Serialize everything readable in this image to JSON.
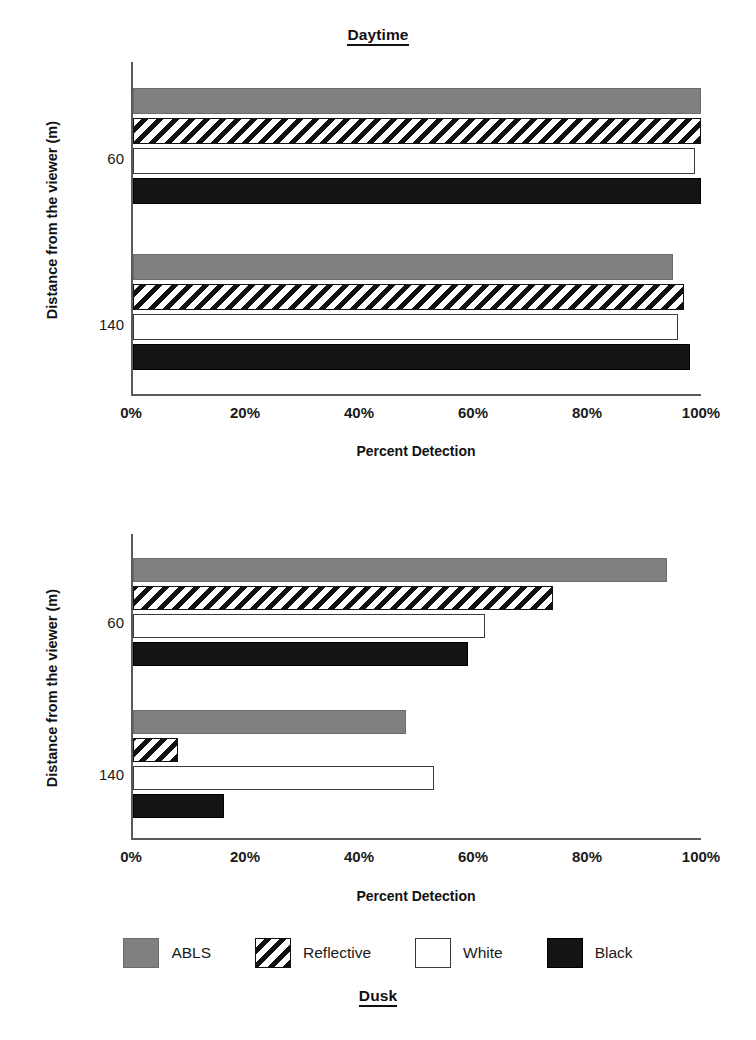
{
  "chart_data": [
    {
      "type": "bar",
      "orientation": "horizontal",
      "title": "Daytime",
      "xlabel": "Percent Detection",
      "ylabel": "Distance from the viewer (m)",
      "categories": [
        "60",
        "140"
      ],
      "xlim": [
        0,
        100
      ],
      "xticks": [
        0,
        20,
        40,
        60,
        80,
        100
      ],
      "xticklabels": [
        "0%",
        "20%",
        "40%",
        "60%",
        "80%",
        "100%"
      ],
      "grid": false,
      "legend_position": "bottom",
      "series": [
        {
          "name": "ABLS",
          "values": [
            100,
            95
          ]
        },
        {
          "name": "Reflective",
          "values": [
            100,
            97
          ]
        },
        {
          "name": "White",
          "values": [
            99,
            96
          ]
        },
        {
          "name": "Black",
          "values": [
            100,
            98
          ]
        }
      ]
    },
    {
      "type": "bar",
      "orientation": "horizontal",
      "title": "Dusk",
      "xlabel": "Percent Detection",
      "ylabel": "Distance from the viewer (m)",
      "categories": [
        "60",
        "140"
      ],
      "xlim": [
        0,
        100
      ],
      "xticks": [
        0,
        20,
        40,
        60,
        80,
        100
      ],
      "xticklabels": [
        "0%",
        "20%",
        "40%",
        "60%",
        "80%",
        "100%"
      ],
      "grid": false,
      "legend_position": "bottom",
      "series": [
        {
          "name": "ABLS",
          "values": [
            94,
            48
          ]
        },
        {
          "name": "Reflective",
          "values": [
            74,
            8
          ]
        },
        {
          "name": "White",
          "values": [
            62,
            53
          ]
        },
        {
          "name": "Black",
          "values": [
            59,
            16
          ]
        }
      ]
    }
  ],
  "panels": {
    "daytime": {
      "title": "Daytime",
      "xlabel": "Percent Detection",
      "ylabel": "Distance from the viewer (m)",
      "yticks": [
        "60",
        "140"
      ],
      "xticklabels": [
        "0%",
        "20%",
        "40%",
        "60%",
        "80%",
        "100%"
      ]
    },
    "dusk": {
      "title": "Dusk",
      "xlabel": "Percent Detection",
      "ylabel": "Distance from the viewer (m)",
      "yticks": [
        "60",
        "140"
      ],
      "xticklabels": [
        "0%",
        "20%",
        "40%",
        "60%",
        "80%",
        "100%"
      ]
    }
  },
  "legend": {
    "items": [
      {
        "label": "ABLS",
        "style": "solid-gray",
        "color": "#808080"
      },
      {
        "label": "Reflective",
        "style": "diagonal-hatch",
        "color": "#111111"
      },
      {
        "label": "White",
        "style": "outline",
        "color": "#ffffff"
      },
      {
        "label": "Black",
        "style": "solid-black",
        "color": "#141414"
      }
    ]
  },
  "colors": {
    "abls": "#808080",
    "reflective": "#111111",
    "white": "#ffffff",
    "black": "#141414",
    "axis": "#5a5a5a",
    "text": "#1a1a1a"
  }
}
